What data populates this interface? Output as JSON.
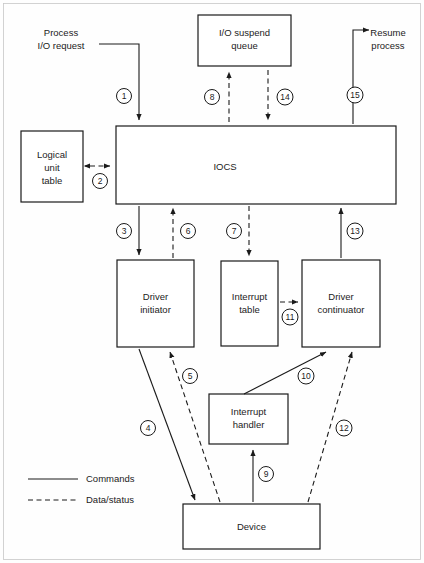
{
  "diagram": {
    "legend": {
      "commands": {
        "label": "Commands",
        "style": "solid"
      },
      "data_status": {
        "label": "Data/status",
        "style": "dashed"
      }
    },
    "boxes": [
      {
        "id": "io_suspend_queue",
        "label_line1": "I/O suspend",
        "label_line2": "queue",
        "x": 198,
        "y": 15,
        "w": 93,
        "h": 51
      },
      {
        "id": "logical_unit_table",
        "label_line1": "Logical",
        "label_line2": "unit",
        "label_line3": "table",
        "x": 21,
        "y": 131,
        "w": 62,
        "h": 71
      },
      {
        "id": "iocs",
        "label_line1": "IOCS",
        "x": 116,
        "y": 126,
        "w": 280,
        "h": 78
      },
      {
        "id": "driver_initiator",
        "label_line1": "Driver",
        "label_line2": "initiator",
        "x": 117,
        "y": 260,
        "w": 77,
        "h": 87
      },
      {
        "id": "interrupt_table",
        "label_line1": "Interrupt",
        "label_line2": "table",
        "x": 221,
        "y": 261,
        "w": 57,
        "h": 85
      },
      {
        "id": "driver_continuator",
        "label_line1": "Driver",
        "label_line2": "continuator",
        "x": 302,
        "y": 260,
        "w": 78,
        "h": 87
      },
      {
        "id": "interrupt_handler",
        "label_line1": "Interrupt",
        "label_line2": "handler",
        "x": 209,
        "y": 394,
        "w": 79,
        "h": 50
      },
      {
        "id": "device",
        "label_line1": "Device",
        "x": 183,
        "y": 504,
        "w": 137,
        "h": 45
      }
    ],
    "external_labels": [
      {
        "id": "process_io_request",
        "line1": "Process",
        "line2": "I/O request"
      },
      {
        "id": "resume_process",
        "line1": "Resume",
        "line2": "process"
      }
    ],
    "flows": [
      {
        "number": "1",
        "from": "process_io_request",
        "to": "iocs",
        "style": "solid",
        "label": "I/O request into IOCS"
      },
      {
        "number": "2",
        "from": "logical_unit_table",
        "to": "iocs",
        "style": "dashed",
        "label": "Logical unit table lookup"
      },
      {
        "number": "3",
        "from": "iocs",
        "to": "driver_initiator",
        "style": "solid",
        "label": "Invoke driver initiator"
      },
      {
        "number": "4",
        "from": "driver_initiator",
        "to": "device",
        "style": "solid",
        "label": "Start I/O on device"
      },
      {
        "number": "5",
        "from": "device",
        "to": "driver_initiator",
        "style": "dashed",
        "label": "Device status to initiator"
      },
      {
        "number": "6",
        "from": "driver_initiator",
        "to": "iocs",
        "style": "dashed",
        "label": "Status back to IOCS"
      },
      {
        "number": "7",
        "from": "iocs",
        "to": "interrupt_table",
        "style": "dashed",
        "label": "Update interrupt table"
      },
      {
        "number": "8",
        "from": "iocs",
        "to": "io_suspend_queue",
        "style": "dashed",
        "label": "Suspend process on I/O"
      },
      {
        "number": "9",
        "from": "device",
        "to": "interrupt_handler",
        "style": "solid",
        "label": "Device interrupt"
      },
      {
        "number": "10",
        "from": "interrupt_handler",
        "to": "driver_continuator",
        "style": "solid",
        "label": "Activate driver continuator"
      },
      {
        "number": "11",
        "from": "interrupt_table",
        "to": "driver_continuator",
        "style": "dashed",
        "label": "Interrupt table data"
      },
      {
        "number": "12",
        "from": "device",
        "to": "driver_continuator",
        "style": "dashed",
        "label": "Device data/status"
      },
      {
        "number": "13",
        "from": "driver_continuator",
        "to": "iocs",
        "style": "solid",
        "label": "Return to IOCS"
      },
      {
        "number": "14",
        "from": "io_suspend_queue",
        "to": "iocs",
        "style": "dashed",
        "label": "Dequeue suspended process"
      },
      {
        "number": "15",
        "from": "iocs",
        "to": "resume_process",
        "style": "solid",
        "label": "Resume the process"
      }
    ],
    "colors": {
      "stroke": "#1a1a1a",
      "background": "#ffffff",
      "frame": "#c8c8c8"
    }
  }
}
